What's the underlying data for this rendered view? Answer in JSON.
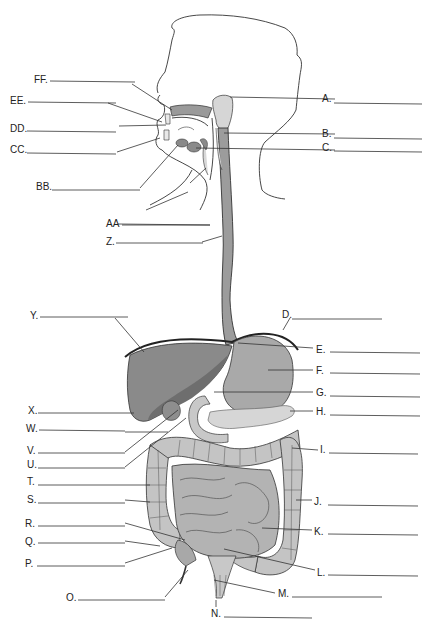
{
  "colors": {
    "background": "#ffffff",
    "liver": "#8a8a8a",
    "liver_dark": "#6e6e6e",
    "stomach": "#a9a9a9",
    "esophagus": "#9c9c9c",
    "pancreas": "#d6d6d6",
    "large_intestine": "#c4c4c4",
    "small_intestine": "#b3b3b3",
    "salivary": "#d2d2d2",
    "line": "#333333"
  },
  "labels": [
    {
      "id": "A",
      "text": "A.",
      "side": "right",
      "y": 98
    },
    {
      "id": "B",
      "text": "B.",
      "side": "right",
      "y": 133
    },
    {
      "id": "C",
      "text": "C.",
      "side": "right",
      "y": 148
    },
    {
      "id": "D",
      "text": "D.",
      "side": "right",
      "y": 316
    },
    {
      "id": "E",
      "text": "E.",
      "side": "right",
      "y": 349
    },
    {
      "id": "F",
      "text": "F.",
      "side": "right",
      "y": 370
    },
    {
      "id": "G",
      "text": "G.",
      "side": "right",
      "y": 392
    },
    {
      "id": "H",
      "text": "H.",
      "side": "right",
      "y": 412
    },
    {
      "id": "I",
      "text": "I.",
      "side": "right",
      "y": 450
    },
    {
      "id": "J",
      "text": "J.",
      "side": "right",
      "y": 502
    },
    {
      "id": "K",
      "text": "K.",
      "side": "right",
      "y": 531
    },
    {
      "id": "L",
      "text": "L.",
      "side": "right",
      "y": 572
    },
    {
      "id": "M",
      "text": "M.",
      "side": "right",
      "y": 594
    },
    {
      "id": "N",
      "text": "N.",
      "side": "bottom",
      "y": 614
    },
    {
      "id": "O",
      "text": "O.",
      "side": "left",
      "y": 598
    },
    {
      "id": "P",
      "text": "P.",
      "side": "left",
      "y": 564
    },
    {
      "id": "Q",
      "text": "Q.",
      "side": "left",
      "y": 542
    },
    {
      "id": "R",
      "text": "R.",
      "side": "left",
      "y": 523
    },
    {
      "id": "S",
      "text": "S.",
      "side": "left",
      "y": 500
    },
    {
      "id": "T",
      "text": "T.",
      "side": "left",
      "y": 482
    },
    {
      "id": "U",
      "text": "U.",
      "side": "left",
      "y": 465
    },
    {
      "id": "V",
      "text": "V.",
      "side": "left",
      "y": 451
    },
    {
      "id": "W",
      "text": "W.",
      "side": "left",
      "y": 429
    },
    {
      "id": "X",
      "text": "X.",
      "side": "left",
      "y": 411
    },
    {
      "id": "Y",
      "text": "Y.",
      "side": "left",
      "y": 316
    },
    {
      "id": "Z",
      "text": "Z.",
      "side": "left",
      "y": 242
    },
    {
      "id": "AA",
      "text": "AA",
      "side": "left",
      "y": 224
    },
    {
      "id": "BB",
      "text": "BB.",
      "side": "left",
      "y": 187
    },
    {
      "id": "CC",
      "text": "CC.",
      "side": "left",
      "y": 150
    },
    {
      "id": "DD",
      "text": "DD.",
      "side": "left",
      "y": 129
    },
    {
      "id": "EE",
      "text": "EE.",
      "side": "left",
      "y": 101
    },
    {
      "id": "FF",
      "text": "FF.",
      "side": "left",
      "y": 80
    }
  ]
}
